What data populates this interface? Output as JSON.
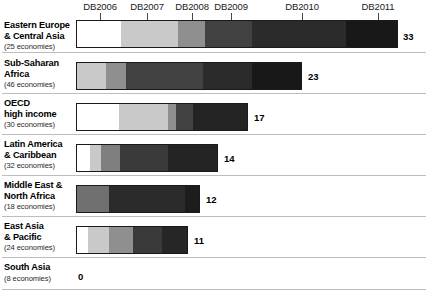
{
  "chart_data": {
    "type": "bar",
    "orientation": "horizontal",
    "stacked": true,
    "title": "",
    "xlabel": "",
    "ylabel": "",
    "grid": false,
    "legend_position": "top-axis-labels",
    "categories": [
      "Eastern Europe & Central Asia",
      "Sub-Saharan Africa",
      "OECD high income",
      "Latin America & Caribbean",
      "Middle East & North Africa",
      "East Asia & Pacific",
      "South Asia"
    ],
    "series": [
      {
        "name": "DB2006",
        "values": [
          5,
          0,
          4,
          1,
          0,
          1,
          0
        ]
      },
      {
        "name": "DB2007",
        "values": [
          6,
          3,
          5,
          1,
          0,
          2,
          0
        ]
      },
      {
        "name": "DB2008",
        "values": [
          3,
          2,
          1,
          2,
          3,
          2,
          0
        ]
      },
      {
        "name": "DB2009",
        "values": [
          4,
          8,
          2,
          5,
          8,
          3,
          0
        ]
      },
      {
        "name": "DB2010",
        "values": [
          10,
          5,
          5,
          5,
          1,
          3,
          0
        ]
      },
      {
        "name": "DB2011",
        "values": [
          5,
          5,
          0,
          0,
          0,
          0,
          0
        ]
      }
    ],
    "totals": [
      33,
      23,
      17,
      14,
      12,
      11,
      0
    ],
    "xlim": [
      0,
      33
    ],
    "units_per_pixel": 9.7
  },
  "axis": {
    "ticks": [
      {
        "label": "DB2006",
        "x": 100
      },
      {
        "label": "DB2007",
        "x": 147
      },
      {
        "label": "DB2008",
        "x": 192
      },
      {
        "label": "DB2009",
        "x": 231
      },
      {
        "label": "DB2010",
        "x": 302
      },
      {
        "label": "DB2011",
        "x": 378
      }
    ]
  },
  "palette": {
    "db2006": "#ffffff",
    "db2007": "#c9c9c9",
    "db2008": "#8f8f8f",
    "db2009": "#4a4a4a",
    "db2010": "#2b2b2b",
    "db2011": "#181818",
    "outline": "#1a1a1a",
    "rule": "#bdbdbd",
    "text": "#000000"
  },
  "rows": [
    {
      "name": "eastern-europe-central-asia",
      "label_line1": "Eastern Europe",
      "label_line2": "& Central Asia",
      "economies": "(25 economies)",
      "total": "33",
      "top": 20,
      "bar_top": 20,
      "bar_left": 76,
      "bar_width": 322,
      "value_x": 403,
      "value_y": 31,
      "rule_y": 52,
      "segments": [
        {
          "series": "DB2006",
          "width": 44,
          "color": "#ffffff"
        },
        {
          "series": "DB2007",
          "width": 58,
          "color": "#c9c9c9"
        },
        {
          "series": "DB2008",
          "width": 27,
          "color": "#8f8f8f"
        },
        {
          "series": "DB2009",
          "width": 47,
          "color": "#414141"
        },
        {
          "series": "DB2010",
          "width": 95,
          "color": "#2b2b2b"
        },
        {
          "series": "DB2011",
          "width": 51,
          "color": "#181818"
        }
      ]
    },
    {
      "name": "sub-saharan-africa",
      "label_line1": "Sub-Saharan",
      "label_line2": "Africa",
      "economies": "(46 economies)",
      "total": "23",
      "top": 58,
      "bar_top": 62,
      "bar_left": 76,
      "bar_width": 226,
      "value_x": 308,
      "value_y": 71,
      "rule_y": 93,
      "segments": [
        {
          "series": "DB2007",
          "width": 29,
          "color": "#c9c9c9"
        },
        {
          "series": "DB2008",
          "width": 20,
          "color": "#8f8f8f"
        },
        {
          "series": "DB2009",
          "width": 78,
          "color": "#414141"
        },
        {
          "series": "DB2010",
          "width": 50,
          "color": "#2b2b2b"
        },
        {
          "series": "DB2011",
          "width": 49,
          "color": "#181818"
        }
      ]
    },
    {
      "name": "oecd-high-income",
      "label_line1": "OECD",
      "label_line2": "high income",
      "economies": "(30 economies)",
      "total": "17",
      "top": 98,
      "bar_top": 103,
      "bar_left": 76,
      "bar_width": 172,
      "value_x": 254,
      "value_y": 112,
      "rule_y": 134,
      "segments": [
        {
          "series": "DB2006",
          "width": 42,
          "color": "#ffffff"
        },
        {
          "series": "DB2007",
          "width": 50,
          "color": "#c9c9c9"
        },
        {
          "series": "DB2008",
          "width": 8,
          "color": "#8f8f8f"
        },
        {
          "series": "DB2009",
          "width": 17,
          "color": "#414141"
        },
        {
          "series": "DB2010",
          "width": 55,
          "color": "#232323"
        }
      ]
    },
    {
      "name": "latin-america-caribbean",
      "label_line1": "Latin America",
      "label_line2": "& Caribbean",
      "economies": "(32 economies)",
      "total": "14",
      "top": 139,
      "bar_top": 144,
      "bar_left": 76,
      "bar_width": 142,
      "value_x": 224,
      "value_y": 153,
      "rule_y": 175,
      "segments": [
        {
          "series": "DB2006",
          "width": 13,
          "color": "#ffffff"
        },
        {
          "series": "DB2007",
          "width": 11,
          "color": "#c9c9c9"
        },
        {
          "series": "DB2008",
          "width": 20,
          "color": "#7f7f7f"
        },
        {
          "series": "DB2009",
          "width": 48,
          "color": "#3a3a3a"
        },
        {
          "series": "DB2010",
          "width": 50,
          "color": "#242424"
        }
      ]
    },
    {
      "name": "middle-east-north-africa",
      "label_line1": "Middle East &",
      "label_line2": "North Africa",
      "economies": "(18 economies)",
      "total": "12",
      "top": 180,
      "bar_top": 185,
      "bar_left": 76,
      "bar_width": 124,
      "value_x": 206,
      "value_y": 194,
      "rule_y": 216,
      "segments": [
        {
          "series": "DB2008",
          "width": 33,
          "color": "#707070"
        },
        {
          "series": "DB2009",
          "width": 77,
          "color": "#2b2b2b"
        },
        {
          "series": "DB2010",
          "width": 14,
          "color": "#1d1d1d"
        }
      ]
    },
    {
      "name": "east-asia-pacific",
      "label_line1": "East Asia",
      "label_line2": "&  Pacific",
      "economies": "(24 economies)",
      "total": "11",
      "top": 221,
      "bar_top": 226,
      "bar_left": 76,
      "bar_width": 112,
      "value_x": 194,
      "value_y": 235,
      "rule_y": 257,
      "segments": [
        {
          "series": "DB2006",
          "width": 11,
          "color": "#ffffff"
        },
        {
          "series": "DB2007",
          "width": 22,
          "color": "#c9c9c9"
        },
        {
          "series": "DB2008",
          "width": 24,
          "color": "#8f8f8f"
        },
        {
          "series": "DB2009",
          "width": 30,
          "color": "#3a3a3a"
        },
        {
          "series": "DB2010",
          "width": 25,
          "color": "#262626"
        }
      ]
    },
    {
      "name": "south-asia",
      "label_line1": "South Asia",
      "label_line2": "",
      "economies": "(8 economies)",
      "total": "0",
      "top": 262,
      "bar_top": 268,
      "bar_left": 76,
      "bar_width": 0,
      "value_x": 78,
      "value_y": 271,
      "rule_y": 289,
      "segments": []
    }
  ]
}
